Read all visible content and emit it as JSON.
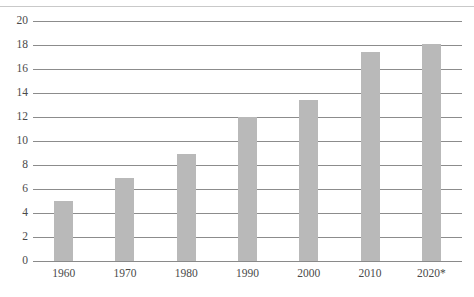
{
  "chart_data": {
    "type": "bar",
    "title": "",
    "subtitle": "",
    "xlabel": "",
    "ylabel": "",
    "categories": [
      "1960",
      "1970",
      "1980",
      "1990",
      "2000",
      "2010",
      "2020*"
    ],
    "values": [
      5.0,
      6.9,
      8.9,
      12.0,
      13.4,
      17.4,
      18.1
    ],
    "series": [
      {
        "name": "",
        "values": [
          5.0,
          6.9,
          8.9,
          12.0,
          13.4,
          17.4,
          18.1
        ]
      }
    ],
    "ylim": [
      0,
      20
    ],
    "ytick_step": 2,
    "yticks": [
      "20",
      "18",
      "16",
      "14",
      "12",
      "10",
      "8",
      "6",
      "4",
      "2",
      "0"
    ],
    "grid": true,
    "grid_axis": "y",
    "legend": false,
    "legend_position": "none",
    "annotations": [],
    "colors": {
      "bar": "#b9b9b9",
      "gridline": "#8c8c8c",
      "axis_text": "#4a4a4a",
      "top_rule": "#c9c9c9",
      "background": "#ffffff"
    }
  }
}
